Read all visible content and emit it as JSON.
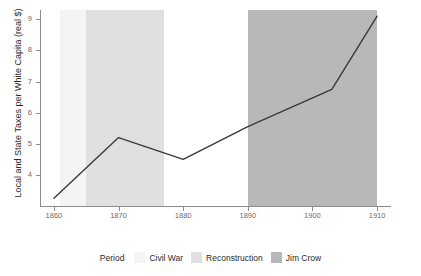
{
  "chart_data": {
    "type": "line",
    "title": "",
    "xlabel": "",
    "ylabel": "Local and State Taxes per White Capita (real $)",
    "xlim": [
      1858,
      1912
    ],
    "ylim": [
      3.0,
      9.3
    ],
    "grid": false,
    "x_ticks": [
      1860,
      1870,
      1880,
      1890,
      1900,
      1910
    ],
    "x_tick_labels": [
      "1860",
      "1870",
      "1880",
      "1890",
      "1900",
      "1910"
    ],
    "y_ticks": [
      4,
      5,
      6,
      7,
      8,
      9
    ],
    "y_tick_labels": [
      "4",
      "5",
      "6",
      "7",
      "8",
      "9"
    ],
    "series": [
      {
        "name": "Local and State Taxes per White Capita (real $)",
        "color": "#3a3a3a",
        "x": [
          1860,
          1870,
          1880,
          1890,
          1903,
          1910
        ],
        "values": [
          3.25,
          5.2,
          4.5,
          5.55,
          6.75,
          9.1
        ]
      }
    ],
    "bands": [
      {
        "label": "Civil War",
        "start": 1861,
        "end": 1865,
        "color": "#f4f4f4"
      },
      {
        "label": "Reconstruction",
        "start": 1865,
        "end": 1877,
        "color": "#e0e0e0"
      },
      {
        "label": "Jim Crow",
        "start": 1890,
        "end": 1910,
        "color": "#b8b8b8"
      }
    ],
    "legend": {
      "position": "bottom",
      "title": "Period",
      "entries": [
        {
          "label": "Civil War",
          "color": "#f4f4f4"
        },
        {
          "label": "Reconstruction",
          "color": "#e0e0e0"
        },
        {
          "label": "Jim Crow",
          "color": "#b8b8b8"
        }
      ]
    },
    "axis_color": "#8c8c8c",
    "tick_label_color": "#6b6b6b",
    "background": "#ffffff"
  }
}
